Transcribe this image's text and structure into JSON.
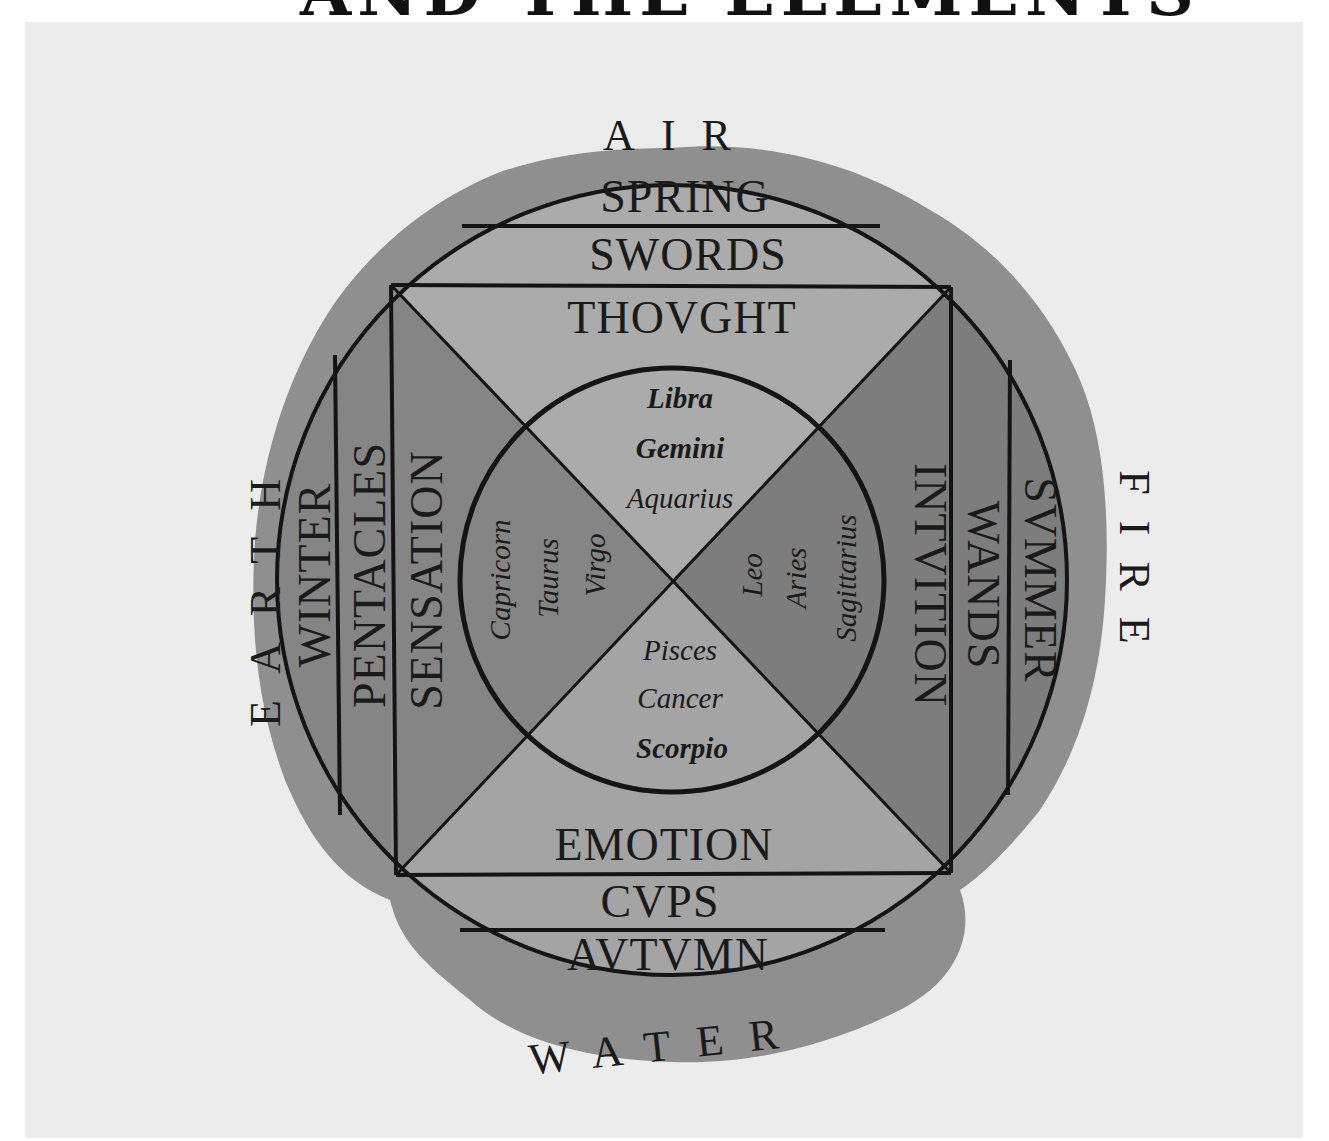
{
  "header": {
    "title": "AND THE ELEMENTS"
  },
  "colors": {
    "page": "#ffffff",
    "paper": "#ececec",
    "wash": "#8f8f8f",
    "light_segment": "#a9a9a9",
    "dark_segment": "#808080",
    "ink": "#141414"
  },
  "diagram": {
    "elements": {
      "top": "AIR",
      "right": "FIRE",
      "bottom": "WATER",
      "left": "EARTH"
    },
    "top": {
      "season": "SPRING",
      "suit": "SWORDS",
      "function": "THOVGHT"
    },
    "right": {
      "season": "SVMMER",
      "suit": "WANDS",
      "function": "INTVITION"
    },
    "bottom": {
      "function": "EMOTION",
      "suit": "CVPS",
      "season": "AVTVMN"
    },
    "left": {
      "season": "WINTER",
      "suit": "PENTACLES",
      "function": "SENSATION"
    },
    "signs": {
      "top": [
        "Libra",
        "Gemini",
        "Aquarius"
      ],
      "right": [
        "Leo",
        "Aries",
        "Sagittarius"
      ],
      "bottom": [
        "Pisces",
        "Cancer",
        "Scorpio"
      ],
      "left": [
        "Capricorn",
        "Taurus",
        "Virgo"
      ]
    }
  }
}
